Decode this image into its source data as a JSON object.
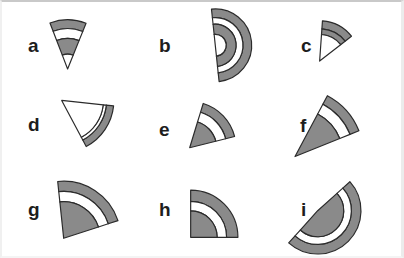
{
  "figure": {
    "type": "shape-panel-grid",
    "rows": 3,
    "columns": 3,
    "background_color": "#ffffff",
    "frame_border_color": "#c9c9c9",
    "outline_color": "#2b2b2b",
    "band_fill_color": "#8a8a8a",
    "gap_fill_color": "#ffffff",
    "label_color": "#1d1d1d"
  },
  "panels": [
    {
      "label": "a",
      "label_x": 26,
      "label_y": 34,
      "shape": "narrow-sector-inverted",
      "center_x": 66,
      "center_y": 68,
      "radius": 50,
      "start_angle": 249,
      "end_angle": 292,
      "rotation": 0,
      "bands": [
        {
          "outer": 1.0,
          "inner": 0.82,
          "fill": "#8a8a8a"
        },
        {
          "outer": 0.82,
          "inner": 0.62,
          "fill": "#ffffff"
        },
        {
          "outer": 0.62,
          "inner": 0.3,
          "fill": "#8a8a8a"
        },
        {
          "outer": 0.3,
          "inner": 0.0,
          "fill": "#ffffff"
        }
      ]
    },
    {
      "label": "b",
      "label_x": 157,
      "label_y": 34,
      "shape": "half-disc",
      "center_x": 216,
      "center_y": 44,
      "radius": 37,
      "start_angle": -96,
      "end_angle": 84,
      "rotation": 0,
      "bands": [
        {
          "outer": 1.0,
          "inner": 0.76,
          "fill": "#8a8a8a"
        },
        {
          "outer": 0.76,
          "inner": 0.58,
          "fill": "#ffffff"
        },
        {
          "outer": 0.58,
          "inner": 0.3,
          "fill": "#8a8a8a"
        },
        {
          "outer": 0.3,
          "inner": 0.0,
          "fill": "#ffffff"
        }
      ]
    },
    {
      "label": "c",
      "label_x": 299,
      "label_y": 34,
      "shape": "narrow-sector",
      "center_x": 322,
      "center_y": 60,
      "radius": 41,
      "start_angle": -86,
      "end_angle": -38,
      "rotation": 0,
      "bands": [
        {
          "outer": 1.0,
          "inner": 0.8,
          "fill": "#8a8a8a"
        },
        {
          "outer": 0.8,
          "inner": 0.66,
          "fill": "#8a8a8a"
        },
        {
          "outer": 0.66,
          "inner": 0.0,
          "fill": "#ffffff"
        }
      ]
    },
    {
      "label": "d",
      "label_x": 26,
      "label_y": 113,
      "shape": "thin-crescent",
      "center_x": 60,
      "center_y": 100,
      "radius": 53,
      "start_angle": 6,
      "end_angle": 62,
      "rotation": 0,
      "bands": [
        {
          "outer": 1.0,
          "inner": 0.86,
          "fill": "#8a8a8a"
        },
        {
          "outer": 0.86,
          "inner": 0.8,
          "fill": "#ffffff"
        },
        {
          "outer": 0.8,
          "inner": 0.0,
          "fill": "#ffffff"
        }
      ]
    },
    {
      "label": "e",
      "label_x": 157,
      "label_y": 118,
      "shape": "flat-sector",
      "center_x": 190,
      "center_y": 148,
      "radius": 47,
      "start_angle": -73,
      "end_angle": -14,
      "rotation": 0,
      "bands": [
        {
          "outer": 1.0,
          "inner": 0.8,
          "fill": "#8a8a8a"
        },
        {
          "outer": 0.8,
          "inner": 0.58,
          "fill": "#ffffff"
        },
        {
          "outer": 0.58,
          "inner": 0.0,
          "fill": "#8a8a8a"
        }
      ]
    },
    {
      "label": "f",
      "label_x": 298,
      "label_y": 114,
      "shape": "elongated-wedge-diagonal",
      "center_x": 297,
      "center_y": 157,
      "radius": 70,
      "start_angle": -62,
      "end_angle": -22,
      "rotation": 0,
      "bands": [
        {
          "outer": 1.0,
          "inner": 0.86,
          "fill": "#8a8a8a"
        },
        {
          "outer": 0.86,
          "inner": 0.7,
          "fill": "#ffffff"
        },
        {
          "outer": 0.7,
          "inner": 0.0,
          "fill": "#8a8a8a"
        }
      ]
    },
    {
      "label": "g",
      "label_x": 26,
      "label_y": 198,
      "shape": "wide-sector",
      "center_x": 62,
      "center_y": 240,
      "radius": 58,
      "start_angle": -96,
      "end_angle": -18,
      "rotation": 0,
      "bands": [
        {
          "outer": 1.0,
          "inner": 0.82,
          "fill": "#8a8a8a"
        },
        {
          "outer": 0.82,
          "inner": 0.64,
          "fill": "#ffffff"
        },
        {
          "outer": 0.64,
          "inner": 0.0,
          "fill": "#8a8a8a"
        }
      ]
    },
    {
      "label": "h",
      "label_x": 157,
      "label_y": 198,
      "shape": "quarter-disc",
      "center_x": 191,
      "center_y": 239,
      "radius": 48,
      "start_angle": -90,
      "end_angle": 0,
      "rotation": 0,
      "bands": [
        {
          "outer": 1.0,
          "inner": 0.76,
          "fill": "#8a8a8a"
        },
        {
          "outer": 0.76,
          "inner": 0.56,
          "fill": "#ffffff"
        },
        {
          "outer": 0.56,
          "inner": 0.0,
          "fill": "#8a8a8a"
        }
      ]
    },
    {
      "label": "i",
      "label_x": 299,
      "label_y": 198,
      "shape": "half-disc-rotated",
      "center_x": 320,
      "center_y": 212,
      "radius": 44,
      "start_angle": -42,
      "end_angle": 132,
      "rotation": 0,
      "bands": [
        {
          "outer": 1.0,
          "inner": 0.78,
          "fill": "#8a8a8a"
        },
        {
          "outer": 0.78,
          "inner": 0.6,
          "fill": "#ffffff"
        },
        {
          "outer": 0.6,
          "inner": 0.0,
          "fill": "#8a8a8a"
        }
      ]
    }
  ]
}
